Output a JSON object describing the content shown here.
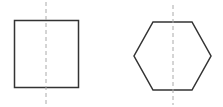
{
  "diagram": {
    "shapes": [
      {
        "name": "square",
        "symmetry_axis": "vertical"
      },
      {
        "name": "hexagon",
        "symmetry_axis": "vertical"
      }
    ],
    "colors": {
      "outline": "#333333",
      "axis": "#aaaaaa",
      "background": "#ffffff"
    }
  }
}
